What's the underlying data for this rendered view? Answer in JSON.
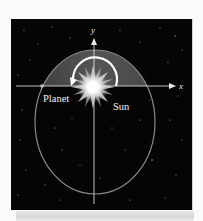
{
  "figure": {
    "type": "orbit-diagram",
    "colors": {
      "background": "#050505",
      "page": "#fbfbfb",
      "shaded_region": "#4d4d4d",
      "orbit": "#8a8a8a",
      "axis": "#d8d8d8",
      "arc_arrow": "#ffffff",
      "label": "#f2f2f2"
    },
    "labels": {
      "planet": "Planet",
      "sun": "Sun",
      "x_axis": "x",
      "y_axis": "y"
    },
    "geometry": {
      "ellipse": {
        "cx": 95,
        "cy": 122,
        "rx": 60,
        "ry": 72
      },
      "x_axis_y": 86,
      "y_axis_x": 94,
      "sun": {
        "cx": 93,
        "cy": 87
      },
      "arc_radius": 22
    }
  }
}
